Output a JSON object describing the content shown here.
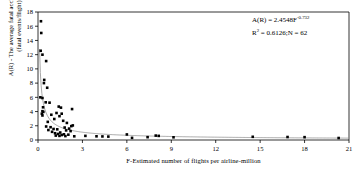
{
  "chart_data": {
    "type": "scatter",
    "title": "",
    "xlabel": "F-Estimated number of flights per airline-million",
    "ylabel_line1": "A(R) - The average fatal accident rate",
    "ylabel_line2": "(fatal events/flight)",
    "xlim": [
      0,
      21
    ],
    "ylim": [
      0,
      18
    ],
    "xticks": [
      0,
      3,
      6,
      9,
      12,
      15,
      18,
      21
    ],
    "yticks": [
      0,
      2,
      4,
      6,
      8,
      10,
      12,
      14,
      16,
      18
    ],
    "xtick_labels": [
      "0",
      "3",
      "6",
      "9",
      "12",
      "15",
      "18",
      "21"
    ],
    "ytick_labels": [
      "0",
      "2",
      "4",
      "6",
      "8",
      "10",
      "12",
      "14",
      "16",
      "18"
    ],
    "grid": false,
    "legend": "none",
    "marker": "square",
    "marker_color": "#000000",
    "curve_color": "#888888",
    "annotation_line1": "A(R) = 2.4548F",
    "annotation_exponent": "-0.732",
    "annotation_line2_a": "R",
    "annotation_line2_sup": "2",
    "annotation_line2_b": " = 0.6126;N = 62",
    "fit": {
      "form": "power",
      "coefficient": 2.4548,
      "exponent": -0.732,
      "r_squared": 0.6126,
      "n": 62
    },
    "points": [
      [
        0.2,
        16.7
      ],
      [
        0.22,
        15.05
      ],
      [
        0.18,
        12.55
      ],
      [
        0.3,
        12.0
      ],
      [
        0.55,
        11.1
      ],
      [
        0.42,
        8.45
      ],
      [
        0.4,
        8.0
      ],
      [
        0.62,
        7.35
      ],
      [
        0.16,
        6.0
      ],
      [
        0.3,
        5.9
      ],
      [
        0.52,
        5.3
      ],
      [
        0.78,
        5.25
      ],
      [
        0.34,
        4.6
      ],
      [
        1.4,
        4.7
      ],
      [
        1.55,
        4.55
      ],
      [
        2.3,
        4.35
      ],
      [
        0.3,
        4.05
      ],
      [
        0.36,
        3.95
      ],
      [
        0.26,
        3.7
      ],
      [
        1.25,
        3.8
      ],
      [
        1.6,
        3.7
      ],
      [
        0.9,
        3.55
      ],
      [
        0.3,
        3.45
      ],
      [
        1.45,
        3.35
      ],
      [
        1.1,
        2.95
      ],
      [
        1.7,
        2.7
      ],
      [
        0.66,
        2.55
      ],
      [
        1.95,
        2.4
      ],
      [
        2.35,
        2.05
      ],
      [
        2.25,
        1.95
      ],
      [
        0.55,
        1.9
      ],
      [
        0.85,
        1.8
      ],
      [
        1.8,
        1.75
      ],
      [
        2.1,
        1.6
      ],
      [
        1.05,
        1.55
      ],
      [
        1.3,
        1.5
      ],
      [
        0.7,
        1.4
      ],
      [
        1.9,
        1.35
      ],
      [
        2.2,
        1.25
      ],
      [
        0.95,
        1.15
      ],
      [
        1.5,
        1.05
      ],
      [
        1.15,
        0.95
      ],
      [
        1.35,
        0.85
      ],
      [
        1.75,
        0.8
      ],
      [
        2.05,
        0.75
      ],
      [
        1.6,
        0.7
      ],
      [
        1.2,
        0.62
      ],
      [
        1.45,
        0.58
      ],
      [
        1.85,
        0.55
      ],
      [
        2.45,
        0.52
      ],
      [
        3.2,
        0.58
      ],
      [
        3.95,
        0.52
      ],
      [
        4.35,
        0.5
      ],
      [
        4.75,
        0.48
      ],
      [
        6.0,
        0.78
      ],
      [
        6.35,
        0.3
      ],
      [
        7.4,
        0.4
      ],
      [
        7.95,
        0.62
      ],
      [
        8.15,
        0.58
      ],
      [
        9.15,
        0.38
      ],
      [
        14.5,
        0.45
      ],
      [
        16.85,
        0.42
      ],
      [
        18.0,
        0.4
      ],
      [
        20.3,
        0.28
      ]
    ]
  }
}
